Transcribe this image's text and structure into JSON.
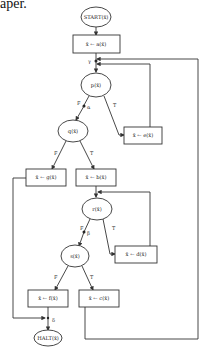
{
  "page_fragment": "aper.",
  "nodes": {
    "start": "START(x̄)",
    "assign_a": "x̄ ← a(x̄)",
    "test_p": "p(x̄)",
    "assign_e": "x̄ ← e(x̄)",
    "test_q": "q(x̄)",
    "assign_g": "x̄ ← g(x̄)",
    "assign_b": "x̄ ← b(x̄)",
    "test_r": "r(x̄)",
    "assign_d": "x̄ ← d(x̄)",
    "test_s": "s(x̄)",
    "assign_f": "x̄ ← f(x̄)",
    "assign_c": "x̄ ← c(x̄)",
    "halt": "HALT(x̄)"
  },
  "edge_labels": {
    "gamma": "γ",
    "p_false": "F",
    "alpha": "α",
    "p_true": "T",
    "q_false": "F",
    "q_true": "T",
    "r_false": "F",
    "beta": "β",
    "r_true": "T",
    "s_false": "F",
    "s_true": "T",
    "delta": "δ"
  }
}
